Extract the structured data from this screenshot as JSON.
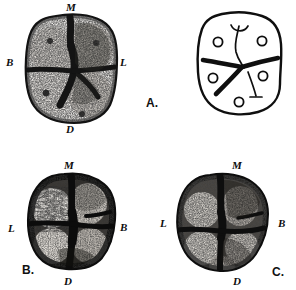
{
  "figure": {
    "caption_panels": [
      "A.",
      "B.",
      "C."
    ],
    "background_color": "#ffffff",
    "ink_color": "#111111"
  },
  "panels": [
    {
      "id": "A",
      "panel_label": "A.",
      "kind": "photograph",
      "description": "occlusal-surface-molar-photograph",
      "orientation_labels": {
        "top": "M",
        "left": "B",
        "right": "L",
        "bottom": "D"
      }
    },
    {
      "id": "A-schematic",
      "panel_label": "A.",
      "kind": "line-diagram",
      "description": "occlusal-groove-pattern-schematic",
      "cusp_count": 5,
      "groove_pattern": "Y-5"
    },
    {
      "id": "B",
      "panel_label": "B.",
      "kind": "photograph",
      "description": "occlusal-surface-molar-photograph",
      "orientation_labels": {
        "top": "M",
        "left": "L",
        "right": "B",
        "bottom": "D"
      }
    },
    {
      "id": "C",
      "panel_label": "C.",
      "kind": "photograph",
      "description": "occlusal-surface-molar-photograph",
      "orientation_labels": {
        "top": "M",
        "left": "L",
        "right": "B",
        "bottom": "D"
      }
    }
  ],
  "labels": {
    "mesial": "M",
    "distal": "D",
    "buccal": "B",
    "lingual": "L",
    "panel_a": "A.",
    "panel_b": "B.",
    "panel_c": "C."
  }
}
